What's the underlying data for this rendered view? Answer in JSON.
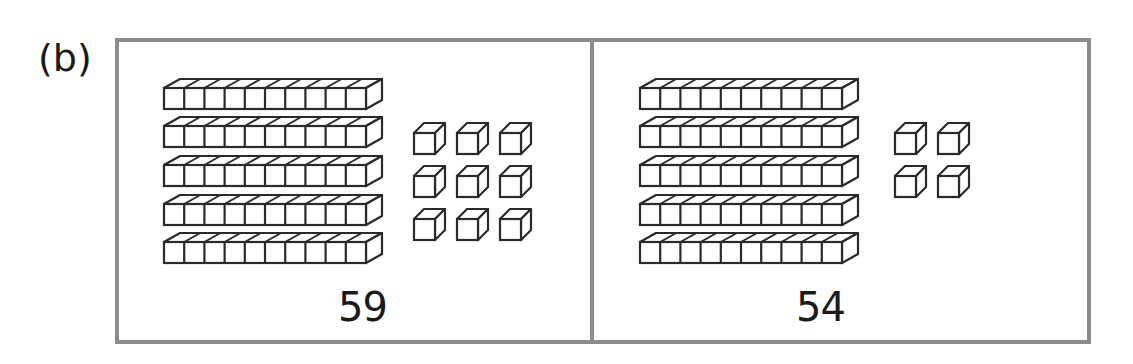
{
  "figure": {
    "part_label": "(b)",
    "frame_color": "#8c8c8c",
    "line_color": "#2a2a2a",
    "panels": [
      {
        "id": "left",
        "number_label": "59",
        "tens": 5,
        "ones": 9,
        "ones_grid": {
          "cols": 3,
          "rows": 3
        }
      },
      {
        "id": "right",
        "number_label": "54",
        "tens": 5,
        "ones": 4,
        "ones_grid": {
          "cols": 2,
          "rows": 2
        }
      }
    ]
  }
}
